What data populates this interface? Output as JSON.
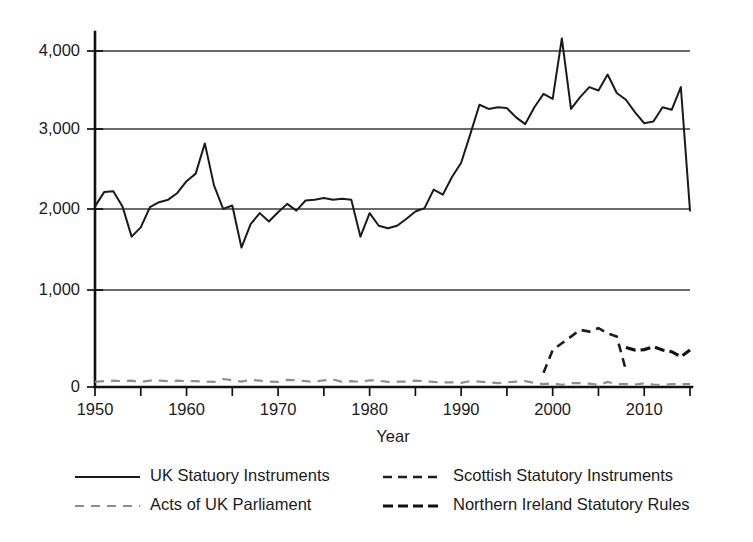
{
  "chart_data": {
    "type": "line",
    "title": "",
    "xlabel": "Year",
    "ylabel": "",
    "xlim": [
      1950,
      2015
    ],
    "ylim": [
      0,
      4200
    ],
    "grid": true,
    "legend_position": "bottom",
    "y_ticks": [
      0,
      1000,
      2000,
      3000,
      4000
    ],
    "y_tick_labels": [
      "0",
      "1,000",
      "2,000",
      "3,000",
      "4,000"
    ],
    "x_ticks": [
      1950,
      1955,
      1960,
      1965,
      1970,
      1975,
      1980,
      1985,
      1990,
      1995,
      2000,
      2005,
      2010,
      2015
    ],
    "x_tick_labels": [
      "1950",
      "",
      "1960",
      "",
      "1970",
      "",
      "1980",
      "",
      "1990",
      "",
      "2000",
      "",
      "2010",
      ""
    ],
    "x_labeled_ticks": [
      1950,
      1960,
      1970,
      1980,
      1990,
      2000,
      2010
    ],
    "gridline_values": [
      1000,
      2000,
      3000,
      4000
    ],
    "series": [
      {
        "name": "UK Statuory Instruments",
        "style": "solid",
        "color": "#1a1a1a",
        "x": [
          1950,
          1951,
          1952,
          1953,
          1954,
          1955,
          1956,
          1957,
          1958,
          1959,
          1960,
          1961,
          1962,
          1963,
          1964,
          1965,
          1966,
          1967,
          1968,
          1969,
          1970,
          1971,
          1972,
          1973,
          1974,
          1975,
          1976,
          1977,
          1978,
          1979,
          1980,
          1981,
          1982,
          1983,
          1984,
          1985,
          1986,
          1987,
          1988,
          1989,
          1990,
          1991,
          1992,
          1993,
          1994,
          1995,
          1996,
          1997,
          1998,
          1999,
          2000,
          2001,
          2002,
          2003,
          2004,
          2005,
          2006,
          2007,
          2008,
          2009,
          2010,
          2011,
          2012,
          2013,
          2014,
          2015
        ],
        "y": [
          2150,
          2320,
          2330,
          2150,
          1790,
          1900,
          2140,
          2200,
          2230,
          2310,
          2450,
          2540,
          2900,
          2400,
          2120,
          2160,
          1660,
          1940,
          2070,
          1970,
          2080,
          2180,
          2100,
          2220,
          2230,
          2250,
          2230,
          2240,
          2230,
          1790,
          2070,
          1920,
          1890,
          1920,
          2000,
          2090,
          2130,
          2350,
          2290,
          2500,
          2670,
          3010,
          3360,
          3310,
          3330,
          3320,
          3210,
          3130,
          3330,
          3490,
          3430,
          4150,
          3310,
          3450,
          3570,
          3530,
          3720,
          3500,
          3420,
          3270,
          3140,
          3160,
          3330,
          3300,
          3570,
          2100
        ]
      },
      {
        "name": "Acts of UK Parliament",
        "style": "dashed-light",
        "color": "#8e8e8e",
        "x": [
          1950,
          1951,
          1952,
          1953,
          1954,
          1955,
          1956,
          1957,
          1958,
          1959,
          1960,
          1961,
          1962,
          1963,
          1964,
          1965,
          1966,
          1967,
          1968,
          1969,
          1970,
          1971,
          1972,
          1973,
          1974,
          1975,
          1976,
          1977,
          1978,
          1979,
          1980,
          1981,
          1982,
          1983,
          1984,
          1985,
          1986,
          1987,
          1988,
          1989,
          1990,
          1991,
          1992,
          1993,
          1994,
          1995,
          1996,
          1997,
          1998,
          1999,
          2000,
          2001,
          2002,
          2003,
          2004,
          2005,
          2006,
          2007,
          2008,
          2009,
          2010,
          2011,
          2012,
          2013,
          2014,
          2015
        ],
        "y": [
          60,
          70,
          75,
          70,
          75,
          60,
          75,
          75,
          70,
          75,
          70,
          70,
          65,
          60,
          95,
          80,
          65,
          85,
          75,
          65,
          60,
          85,
          80,
          70,
          60,
          80,
          90,
          60,
          70,
          60,
          80,
          75,
          60,
          65,
          65,
          75,
          70,
          60,
          55,
          55,
          50,
          70,
          65,
          55,
          45,
          55,
          65,
          70,
          50,
          35,
          45,
          25,
          45,
          45,
          40,
          25,
          60,
          35,
          35,
          30,
          45,
          30,
          25,
          35,
          35,
          35
        ]
      },
      {
        "name": "Scottish Statutory Instruments",
        "style": "dashed",
        "color": "#1d1d1d",
        "x": [
          1999,
          2000,
          2001,
          2002,
          2003,
          2004,
          2005,
          2006,
          2007,
          2008
        ],
        "y": [
          170,
          440,
          520,
          600,
          680,
          660,
          700,
          640,
          600,
          200
        ]
      },
      {
        "name": "Northern Ireland Statutory Rules",
        "style": "dashed-bold",
        "color": "#111111",
        "x": [
          2008,
          2009,
          2010,
          2011,
          2012,
          2013,
          2014,
          2015
        ],
        "y": [
          470,
          440,
          445,
          480,
          440,
          420,
          360,
          440
        ]
      }
    ],
    "legend": [
      {
        "label": "UK Statuory Instruments",
        "style": "solid"
      },
      {
        "label": "Scottish Statutory Instruments",
        "style": "dashed"
      },
      {
        "label": "Acts of UK Parliament",
        "style": "dashed-light"
      },
      {
        "label": "Northern Ireland Statutory Rules",
        "style": "dashed-bold"
      }
    ]
  }
}
